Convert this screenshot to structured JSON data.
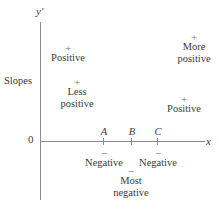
{
  "figure": {
    "axes": {
      "y_label": "y′",
      "x_label": "x",
      "origin_label": "0"
    },
    "side_caption": "Slopes",
    "ticks": [
      {
        "label": "A",
        "x": 103
      },
      {
        "label": "B",
        "x": 131
      },
      {
        "label": "C",
        "x": 157
      }
    ],
    "annotations": [
      {
        "sign": "+",
        "line1": "Positive",
        "line2": "",
        "x": 68,
        "y": 44
      },
      {
        "sign": "+",
        "line1": "More",
        "line2": "positive",
        "x": 194,
        "y": 33
      },
      {
        "sign": "+",
        "line1": "Less",
        "line2": "positive",
        "x": 77,
        "y": 78
      },
      {
        "sign": "+",
        "line1": "Positive",
        "line2": "",
        "x": 184,
        "y": 95
      },
      {
        "sign": "−",
        "line1": "Negative",
        "line2": "",
        "x": 104,
        "y": 150
      },
      {
        "sign": "−",
        "line1": "Negative",
        "line2": "",
        "x": 158,
        "y": 150
      },
      {
        "sign": "−",
        "line1": "Most",
        "line2": "negative",
        "x": 131,
        "y": 168
      }
    ]
  },
  "chart_data": {
    "type": "line",
    "title": "",
    "xlabel": "x",
    "ylabel": "y′",
    "series_caption": "Slopes",
    "categories": [
      "A",
      "B",
      "C"
    ],
    "sign_regions": [
      {
        "region": "left of A, upper",
        "sign": "+",
        "magnitude_label": "Positive"
      },
      {
        "region": "left of A, lower",
        "sign": "+",
        "magnitude_label": "Less positive"
      },
      {
        "region": "A to B",
        "sign": "−",
        "magnitude_label": "Negative"
      },
      {
        "region": "B (between A and C), below",
        "sign": "−",
        "magnitude_label": "Most negative"
      },
      {
        "region": "B to C",
        "sign": "−",
        "magnitude_label": "Negative"
      },
      {
        "region": "right of C, lower",
        "sign": "+",
        "magnitude_label": "Positive"
      },
      {
        "region": "right of C, upper",
        "sign": "+",
        "magnitude_label": "More positive"
      }
    ],
    "grid": false,
    "legend": "none"
  }
}
